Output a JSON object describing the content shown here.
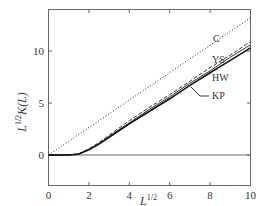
{
  "chart_data": {
    "type": "line",
    "title": "",
    "xlabel": "L^{1/2}",
    "ylabel": "L^{1/2}K(L)",
    "xlim": [
      0,
      10
    ],
    "ylim": [
      -0.7,
      14
    ],
    "xticks": [
      0,
      2,
      4,
      6,
      8,
      10
    ],
    "yticks": [
      0,
      5,
      10
    ],
    "grid": false,
    "legend": "inline labels near curves",
    "series": [
      {
        "name": "C",
        "style": "dotted",
        "x": [
          0,
          10
        ],
        "y": [
          0,
          13.2
        ]
      },
      {
        "name": "YS",
        "style": "dashed",
        "x": [
          0,
          1.0,
          1.5,
          2.0,
          2.5,
          3,
          4,
          5,
          6,
          7,
          8,
          9,
          10
        ],
        "y": [
          0,
          0,
          0.1,
          0.6,
          1.2,
          1.9,
          3.3,
          4.6,
          5.8,
          7.1,
          8.4,
          9.6,
          10.9
        ]
      },
      {
        "name": "HW",
        "style": "solid",
        "x": [
          0,
          1.0,
          1.5,
          2.0,
          2.5,
          3,
          4,
          5,
          6,
          7,
          8,
          9,
          10
        ],
        "y": [
          0,
          0,
          0.1,
          0.55,
          1.1,
          1.8,
          3.1,
          4.4,
          5.6,
          6.9,
          8.1,
          9.4,
          10.6
        ]
      },
      {
        "name": "KP",
        "style": "solid-thick",
        "x": [
          0,
          1.0,
          1.5,
          2.0,
          2.5,
          3,
          4,
          5,
          6,
          7,
          8,
          9,
          10
        ],
        "y": [
          0,
          0,
          0.1,
          0.5,
          1.05,
          1.7,
          3.0,
          4.2,
          5.4,
          6.7,
          7.9,
          9.1,
          10.3
        ]
      }
    ],
    "labels": [
      {
        "text": "C",
        "x": 8.4,
        "y": 10.2
      },
      {
        "text": "YS",
        "x": 8.4,
        "y": 8.0
      },
      {
        "text": "HW",
        "x": 8.4,
        "y": 6.2
      },
      {
        "text": "KP",
        "x": 8.4,
        "y": 4.0
      }
    ]
  },
  "axes": {
    "xlabel_main": "L",
    "xlabel_sup": "1/2",
    "ylabel_main": "L",
    "ylabel_sup": "1/2",
    "ylabel_rest": "K(L)",
    "xtick_labels": [
      "0",
      "2",
      "4",
      "6",
      "8",
      "10"
    ],
    "ytick_labels": [
      "0",
      "5",
      "10"
    ]
  }
}
